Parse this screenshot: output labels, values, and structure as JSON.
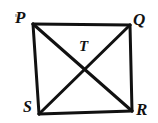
{
  "figure": {
    "kind": "geometry-diagram",
    "background_color": "#ffffff",
    "stroke_color": "#111111",
    "stroke_width": 3,
    "label_color": "#111111",
    "vertices": [
      {
        "id": "P",
        "label": "P",
        "x": 33,
        "y": 24,
        "label_x": 15,
        "label_y": 9
      },
      {
        "id": "Q",
        "label": "Q",
        "x": 130,
        "y": 25,
        "label_x": 133,
        "label_y": 11
      },
      {
        "id": "R",
        "label": "R",
        "x": 132,
        "y": 111,
        "label_x": 136,
        "label_y": 101
      },
      {
        "id": "S",
        "label": "S",
        "x": 39,
        "y": 114,
        "label_x": 23,
        "label_y": 99
      }
    ],
    "interior_point": {
      "id": "T",
      "label": "T",
      "x": 85,
      "y": 68,
      "label_x": 79,
      "label_y": 39
    },
    "sides": [
      {
        "name": "PQ",
        "from": "P",
        "to": "Q"
      },
      {
        "name": "QR",
        "from": "Q",
        "to": "R"
      },
      {
        "name": "RS",
        "from": "R",
        "to": "S"
      },
      {
        "name": "SP",
        "from": "S",
        "to": "P"
      }
    ],
    "diagonals": [
      {
        "name": "PR",
        "from": "P",
        "to": "R"
      },
      {
        "name": "QS",
        "from": "Q",
        "to": "S"
      }
    ]
  }
}
